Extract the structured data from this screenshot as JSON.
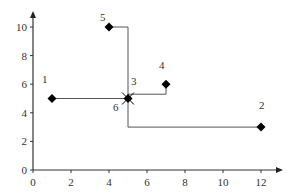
{
  "chart_data": {
    "type": "scatter",
    "title": "",
    "xlabel": "",
    "ylabel": "",
    "xlim": [
      0,
      13
    ],
    "ylim": [
      0,
      11
    ],
    "x_ticks": [
      0,
      2,
      4,
      6,
      8,
      10,
      12
    ],
    "y_ticks": [
      0,
      2,
      4,
      6,
      8,
      10
    ],
    "grid": false,
    "legend": null,
    "points": [
      {
        "label": "1",
        "x": 1,
        "y": 5,
        "marker": "diamond"
      },
      {
        "label": "2",
        "x": 12,
        "y": 3,
        "marker": "diamond"
      },
      {
        "label": "3",
        "x": 5,
        "y": 5,
        "marker": "star"
      },
      {
        "label": "4",
        "x": 7,
        "y": 6,
        "marker": "diamond"
      },
      {
        "label": "5",
        "x": 4,
        "y": 10,
        "marker": "diamond"
      },
      {
        "label": "6",
        "x": 5,
        "y": 5,
        "marker": "none"
      }
    ],
    "connectors": [
      {
        "from": "1",
        "to": "3",
        "path": [
          [
            1,
            5
          ],
          [
            5,
            5
          ]
        ]
      },
      {
        "from": "5",
        "to": "3",
        "path": [
          [
            4,
            10
          ],
          [
            5,
            10
          ],
          [
            5,
            5
          ]
        ]
      },
      {
        "from": "4",
        "to": "3",
        "path": [
          [
            7,
            6
          ],
          [
            7,
            5.3
          ],
          [
            5,
            5.3
          ]
        ]
      },
      {
        "from": "2",
        "to": "3",
        "path": [
          [
            12,
            3
          ],
          [
            5,
            3
          ],
          [
            5,
            5
          ]
        ]
      }
    ]
  }
}
